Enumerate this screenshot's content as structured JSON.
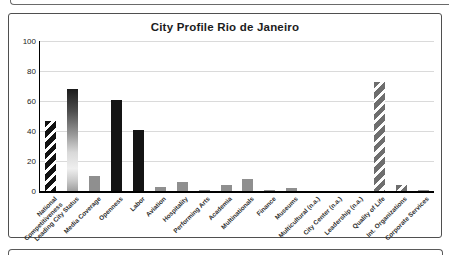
{
  "chart_data": {
    "type": "bar",
    "title": "City Profile Rio de Janeiro",
    "categories": [
      "National\nCompetitiveness",
      "Leading City Status",
      "Media Coverage",
      "Openness",
      "Labor",
      "Aviation",
      "Hospitality",
      "Performing Arts",
      "Academia",
      "Multinationals",
      "Finance",
      "Museums",
      "Multicultural (n.a.)",
      "City Center (n.a.)",
      "Leadership (n.a.)",
      "Quality of Life",
      "Int. Organizations",
      "Corporate Services"
    ],
    "values": [
      47,
      68,
      10,
      61,
      41,
      3,
      6,
      0.5,
      4,
      8,
      0.5,
      2,
      0,
      0,
      0,
      73,
      4,
      0.5
    ],
    "bar_styles": [
      "hatch-black",
      "gradient",
      "solid-gray",
      "solid-black",
      "solid-black",
      "solid-gray",
      "solid-gray",
      "solid-gray",
      "solid-gray",
      "solid-gray",
      "solid-gray",
      "solid-gray",
      "none",
      "none",
      "none",
      "hatch-gray",
      "hatch-gray",
      "solid-gray"
    ],
    "xlabel": "",
    "ylabel": "",
    "ylim": [
      0,
      100
    ],
    "yticks": [
      0,
      20,
      40,
      60,
      80,
      100
    ],
    "grid": true,
    "legend": "none",
    "colors": {
      "solid_black": "#141414",
      "solid_gray": "#8f8f8f",
      "hatch_black_base": "#121212",
      "hatch_gray_base": "#6e6e6e",
      "hatch_stripe": "#ffffff",
      "gridline": "#dadada",
      "axis": "#000000",
      "frame_border": "#4f4f4f",
      "title_text": "#1c1c1c",
      "label_text": "#2e2e2e",
      "background": "#ffffff"
    }
  }
}
